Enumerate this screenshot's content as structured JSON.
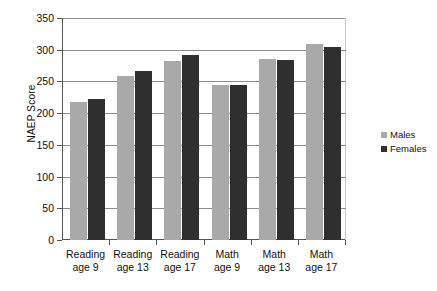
{
  "chart_data": {
    "type": "bar",
    "title": "",
    "xlabel": "",
    "ylabel": "NAEP Score",
    "ylim": [
      0,
      350
    ],
    "ytick_step": 50,
    "yticks": [
      "350",
      "300",
      "250",
      "200",
      "150",
      "100",
      "50",
      "0"
    ],
    "grid": true,
    "legend_position": "right",
    "categories": [
      "Reading age 9",
      "Reading age 13",
      "Reading age 17",
      "Math age 9",
      "Math age 13",
      "Math age 17"
    ],
    "category_lines": [
      [
        "Reading",
        "age 9"
      ],
      [
        "Reading",
        "age 13"
      ],
      [
        "Reading",
        "age 17"
      ],
      [
        "Math",
        "age 9"
      ],
      [
        "Math",
        "age 13"
      ],
      [
        "Math",
        "age 17"
      ]
    ],
    "series": [
      {
        "name": "Males",
        "color": "#a9a9a9",
        "values": [
          218,
          258,
          282,
          245,
          286,
          309
        ]
      },
      {
        "name": "Females",
        "color": "#2f2f2f",
        "values": [
          223,
          267,
          291,
          245,
          284,
          304
        ]
      }
    ]
  },
  "legend": {
    "items": [
      {
        "label": "Males",
        "color": "#a9a9a9"
      },
      {
        "label": "Females",
        "color": "#2f2f2f"
      }
    ]
  },
  "colors": {
    "males": "#a9a9a9",
    "females": "#2f2f2f",
    "gridline": "#8d8d8d",
    "axis": "#555555",
    "background": "#ffffff",
    "text": "#111111"
  }
}
